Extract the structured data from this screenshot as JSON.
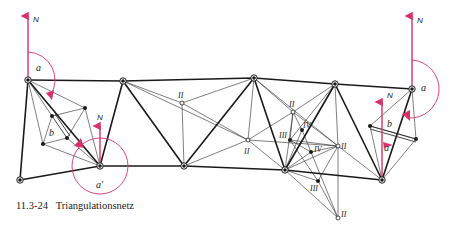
{
  "caption": {
    "number": "11.3-24",
    "title": "Triangulationsnetz"
  },
  "colors": {
    "line": "#1a1a1a",
    "accent": "#d6336c",
    "background": "#ffffff"
  },
  "labels": {
    "north": "N",
    "azimuth": "a",
    "azimuth_prime": "a′",
    "base": "b",
    "order_2": "II",
    "order_3": "III",
    "order_4": "IV"
  },
  "nodes": {
    "main": [
      {
        "id": "A",
        "x": 28,
        "y": 80
      },
      {
        "id": "B",
        "x": 20,
        "y": 180
      },
      {
        "id": "C",
        "x": 100,
        "y": 166
      },
      {
        "id": "D",
        "x": 123,
        "y": 81
      },
      {
        "id": "E",
        "x": 184,
        "y": 166
      },
      {
        "id": "F",
        "x": 254,
        "y": 78
      },
      {
        "id": "G",
        "x": 285,
        "y": 170
      },
      {
        "id": "H",
        "x": 335,
        "y": 84
      },
      {
        "id": "I",
        "x": 412,
        "y": 89
      },
      {
        "id": "J",
        "x": 382,
        "y": 180
      }
    ],
    "order_2": [
      {
        "x": 182,
        "y": 103
      },
      {
        "x": 248,
        "y": 140
      },
      {
        "x": 293,
        "y": 112
      },
      {
        "x": 338,
        "y": 146
      },
      {
        "x": 338,
        "y": 218
      }
    ],
    "order_3": [
      {
        "x": 290,
        "y": 140
      },
      {
        "x": 318,
        "y": 181
      }
    ],
    "order_4": [
      {
        "x": 302,
        "y": 130
      },
      {
        "x": 311,
        "y": 152
      }
    ],
    "base_left": [
      {
        "x": 52,
        "y": 116
      },
      {
        "x": 43,
        "y": 144
      },
      {
        "x": 67,
        "y": 138
      },
      {
        "x": 85,
        "y": 108
      }
    ],
    "base_right": [
      {
        "x": 370,
        "y": 126
      },
      {
        "x": 416,
        "y": 139
      }
    ]
  }
}
